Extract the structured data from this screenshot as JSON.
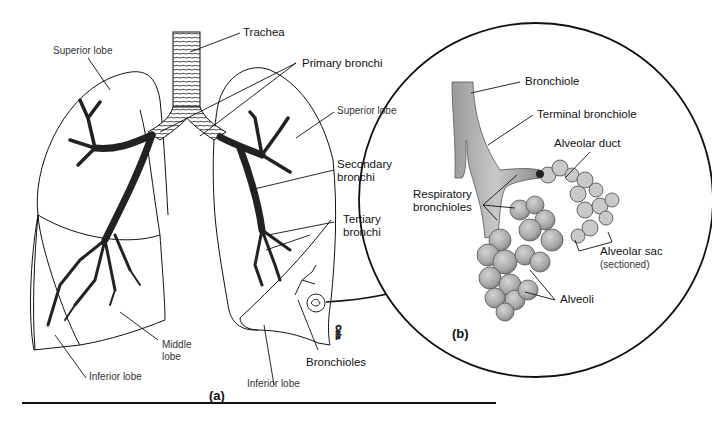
{
  "figure": {
    "panel_a": {
      "tag": "(a)",
      "labels": {
        "trachea": "Trachea",
        "primary_bronchi": "Primary bronchi",
        "superior_lobe_left": "Superior lobe",
        "superior_lobe_right": "Superior lobe",
        "secondary_bronchi_line1": "Secondary",
        "secondary_bronchi_line2": "bronchi",
        "tertiary_bronchi_line1": "Tertiary",
        "tertiary_bronchi_line2": "bronchi",
        "middle_lobe_line1": "Middle",
        "middle_lobe_line2": "lobe",
        "inferior_lobe_left": "Inferior lobe",
        "inferior_lobe_right": "Inferior lobe",
        "bronchioles": "Bronchioles"
      }
    },
    "panel_b": {
      "tag": "(b)",
      "labels": {
        "bronchiole": "Bronchiole",
        "terminal_bronchiole": "Terminal bronchiole",
        "alveolar_duct": "Alveolar duct",
        "respiratory_bronchioles_line1": "Respiratory",
        "respiratory_bronchioles_line2": "bronchioles",
        "alveolar_sac": "Alveolar sac",
        "alveolar_sac_note": "(sectioned)",
        "alveoli": "Alveoli"
      }
    },
    "colors": {
      "line": "#111111",
      "tissue_fill": "#b8b8b8",
      "tissue_dark": "#8a8a8a",
      "background": "#ffffff"
    }
  }
}
